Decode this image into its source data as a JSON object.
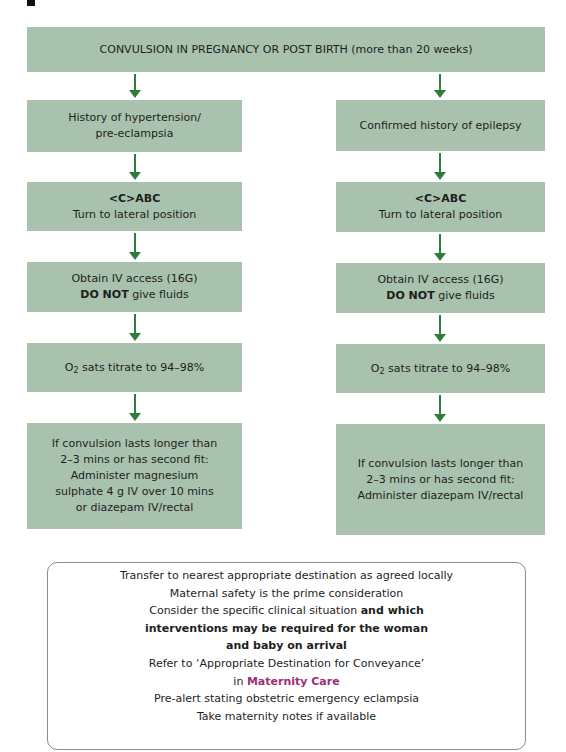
{
  "colors": {
    "box_fill": "#a9c2ae",
    "arrow": "#2e7d3a",
    "link": "#9c2f7d",
    "border": "#8a8a8a"
  },
  "top": {
    "title": "CONVULSION IN PREGNANCY OR POST BIRTH (more than 20 weeks)"
  },
  "left": {
    "condition": [
      "History of hypertension/",
      "pre-eclampsia"
    ],
    "abc": {
      "bold": "<C>ABC",
      "text": "Turn to lateral position"
    },
    "iv": {
      "line1": "Obtain IV access (16G)",
      "bold": "DO NOT",
      "rest": " give fluids"
    },
    "o2": {
      "pre": "O",
      "sub": "2",
      "post": " sats titrate to 94–98%"
    },
    "treatment": [
      "If convulsion lasts longer than",
      "2–3 mins or has second fit:",
      "Administer magnesium",
      "sulphate 4 g IV over 10 mins",
      "or diazepam IV/rectal"
    ]
  },
  "right": {
    "condition": [
      "Confirmed history of epilepsy"
    ],
    "abc": {
      "bold": "<C>ABC",
      "text": "Turn to lateral position"
    },
    "iv": {
      "line1": "Obtain IV access (16G)",
      "bold": "DO NOT",
      "rest": " give fluids"
    },
    "o2": {
      "pre": "O",
      "sub": "2",
      "post": " sats titrate to 94–98%"
    },
    "treatment": [
      "If convulsion lasts longer than",
      "2–3 mins or has second fit:",
      "Administer diazepam IV/rectal"
    ]
  },
  "info": {
    "l1": "Transfer to nearest appropriate destination as agreed locally",
    "l2": "Maternal safety is the prime consideration",
    "l3_plain": "Consider the specific clinical situation ",
    "l3_bold": "and which",
    "l4": "interventions may be required for the woman",
    "l5": "and baby on arrival",
    "l6": "Refer to ‘Appropriate Destination for Conveyance’",
    "l7_plain": "in ",
    "l7_link": "Maternity Care",
    "l8": "Pre-alert stating obstetric emergency eclampsia",
    "l9": "Take maternity notes if available"
  }
}
